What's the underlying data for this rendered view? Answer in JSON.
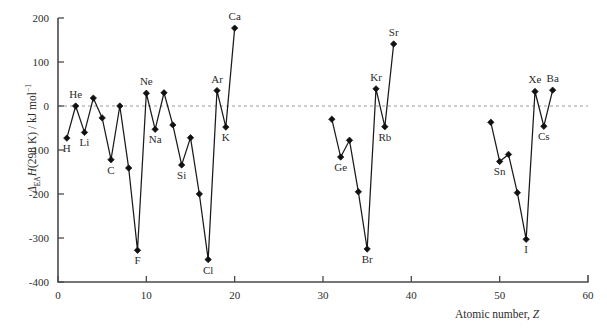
{
  "chart_data": {
    "type": "line",
    "title": "",
    "subtitle": "",
    "xlabel": "Atomic number, Z",
    "ylabel": "ΔEAH(298 K) / kJ mol⁻¹",
    "ylabel_parts": {
      "delta": "Δ",
      "sub": "EA",
      "h": "H",
      "paren": "(298 K)",
      "slash": " / kJ mol",
      "sup": "−1"
    },
    "xlim": [
      0,
      60
    ],
    "ylim": [
      -400,
      200
    ],
    "xticks": [
      0,
      10,
      20,
      30,
      40,
      50,
      60
    ],
    "yticks": [
      -400,
      -300,
      -200,
      -100,
      0,
      100,
      200
    ],
    "xtick_labels": [
      "0",
      "10",
      "20",
      "30",
      "40",
      "50",
      "60"
    ],
    "ytick_labels": [
      "-400",
      "-300",
      "-200",
      "-100",
      "0",
      "100",
      "200"
    ],
    "grid": false,
    "zero_reference_line": true,
    "legend": null,
    "marker": "diamond",
    "segments": [
      {
        "name": "period-1-to-4s",
        "points": [
          {
            "x": 1,
            "y": -73,
            "element": "H",
            "label": "H",
            "label_pos": "below"
          },
          {
            "x": 2,
            "y": 0,
            "element": "He",
            "label": "He",
            "label_pos": "above"
          },
          {
            "x": 3,
            "y": -60,
            "element": "Li",
            "label": "Li",
            "label_pos": "below"
          },
          {
            "x": 4,
            "y": 18,
            "element": "Be",
            "label": "",
            "label_pos": "none"
          },
          {
            "x": 5,
            "y": -27,
            "element": "B",
            "label": "",
            "label_pos": "none"
          },
          {
            "x": 6,
            "y": -122,
            "element": "C",
            "label": "C",
            "label_pos": "below"
          },
          {
            "x": 7,
            "y": 0,
            "element": "N",
            "label": "",
            "label_pos": "none"
          },
          {
            "x": 8,
            "y": -141,
            "element": "O",
            "label": "",
            "label_pos": "none"
          },
          {
            "x": 9,
            "y": -328,
            "element": "F",
            "label": "F",
            "label_pos": "below"
          },
          {
            "x": 10,
            "y": 29,
            "element": "Ne",
            "label": "Ne",
            "label_pos": "above"
          },
          {
            "x": 11,
            "y": -53,
            "element": "Na",
            "label": "Na",
            "label_pos": "below"
          },
          {
            "x": 12,
            "y": 30,
            "element": "Mg",
            "label": "",
            "label_pos": "none"
          },
          {
            "x": 13,
            "y": -43,
            "element": "Al",
            "label": "",
            "label_pos": "none"
          },
          {
            "x": 14,
            "y": -134,
            "element": "Si",
            "label": "Si",
            "label_pos": "below"
          },
          {
            "x": 15,
            "y": -72,
            "element": "P",
            "label": "",
            "label_pos": "none"
          },
          {
            "x": 16,
            "y": -200,
            "element": "S",
            "label": "",
            "label_pos": "none"
          },
          {
            "x": 17,
            "y": -349,
            "element": "Cl",
            "label": "Cl",
            "label_pos": "below"
          },
          {
            "x": 18,
            "y": 35,
            "element": "Ar",
            "label": "Ar",
            "label_pos": "above"
          },
          {
            "x": 19,
            "y": -48,
            "element": "K",
            "label": "K",
            "label_pos": "below"
          },
          {
            "x": 20,
            "y": 177,
            "element": "Ca",
            "label": "Ca",
            "label_pos": "above"
          }
        ]
      },
      {
        "name": "period-4p-to-5s",
        "points": [
          {
            "x": 31,
            "y": -30,
            "element": "Ga",
            "label": "",
            "label_pos": "none"
          },
          {
            "x": 32,
            "y": -116,
            "element": "Ge",
            "label": "Ge",
            "label_pos": "below"
          },
          {
            "x": 33,
            "y": -78,
            "element": "As",
            "label": "",
            "label_pos": "none"
          },
          {
            "x": 34,
            "y": -195,
            "element": "Se",
            "label": "",
            "label_pos": "none"
          },
          {
            "x": 35,
            "y": -325,
            "element": "Br",
            "label": "Br",
            "label_pos": "below"
          },
          {
            "x": 36,
            "y": 39,
            "element": "Kr",
            "label": "Kr",
            "label_pos": "above"
          },
          {
            "x": 37,
            "y": -47,
            "element": "Rb",
            "label": "Rb",
            "label_pos": "below"
          },
          {
            "x": 38,
            "y": 141,
            "element": "Sr",
            "label": "Sr",
            "label_pos": "above"
          }
        ]
      },
      {
        "name": "period-5p-to-6s",
        "points": [
          {
            "x": 49,
            "y": -37,
            "element": "In",
            "label": "",
            "label_pos": "none"
          },
          {
            "x": 50,
            "y": -126,
            "element": "Sn",
            "label": "Sn",
            "label_pos": "below"
          },
          {
            "x": 51,
            "y": -110,
            "element": "Sb",
            "label": "",
            "label_pos": "none"
          },
          {
            "x": 52,
            "y": -197,
            "element": "Te",
            "label": "",
            "label_pos": "none"
          },
          {
            "x": 53,
            "y": -303,
            "element": "I",
            "label": "I",
            "label_pos": "below"
          },
          {
            "x": 54,
            "y": 33,
            "element": "Xe",
            "label": "Xe",
            "label_pos": "above"
          },
          {
            "x": 55,
            "y": -46,
            "element": "Cs",
            "label": "Cs",
            "label_pos": "below"
          },
          {
            "x": 56,
            "y": 36,
            "element": "Ba",
            "label": "Ba",
            "label_pos": "above"
          }
        ]
      }
    ],
    "colors": {
      "line": "#1a1a1a",
      "marker": "#111111",
      "axis": "#4a4a4a",
      "zero_line": "#9a9a9a",
      "text": "#2b2b2b",
      "background": "#ffffff"
    }
  }
}
